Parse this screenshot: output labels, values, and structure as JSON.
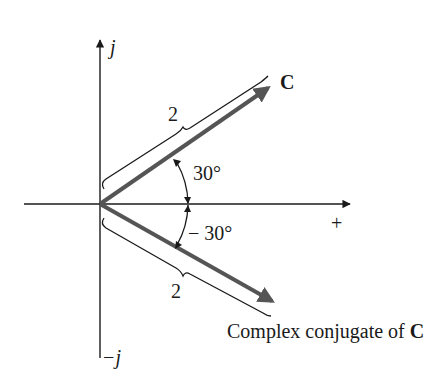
{
  "figure": {
    "axes": {
      "imag_positive_label": "j",
      "imag_negative_label": "−j",
      "real_positive_label": "+"
    },
    "vectors": [
      {
        "name": "C",
        "label": "C",
        "magnitude_label": "2",
        "angle_label": "30°",
        "magnitude": 2,
        "angle_deg": 30
      },
      {
        "name": "conjugate",
        "label_prefix": "Complex conjugate of ",
        "label_bold": "C",
        "magnitude_label": "2",
        "angle_label": "− 30°",
        "magnitude": 2,
        "angle_deg": -30
      }
    ],
    "colors": {
      "axis": "#1a1a1a",
      "vector": "#555555",
      "text": "#1a1a1a"
    }
  }
}
